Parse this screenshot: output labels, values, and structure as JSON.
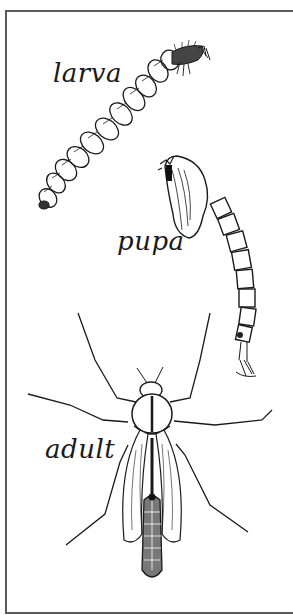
{
  "figure": {
    "stages": [
      {
        "id": "larva",
        "label": "larva"
      },
      {
        "id": "pupa",
        "label": "pupa"
      },
      {
        "id": "adult",
        "label": "adult"
      }
    ],
    "colors": {
      "ink": "#1a1a1a",
      "frame": "#5a5a5a",
      "background": "#ffffff"
    }
  }
}
